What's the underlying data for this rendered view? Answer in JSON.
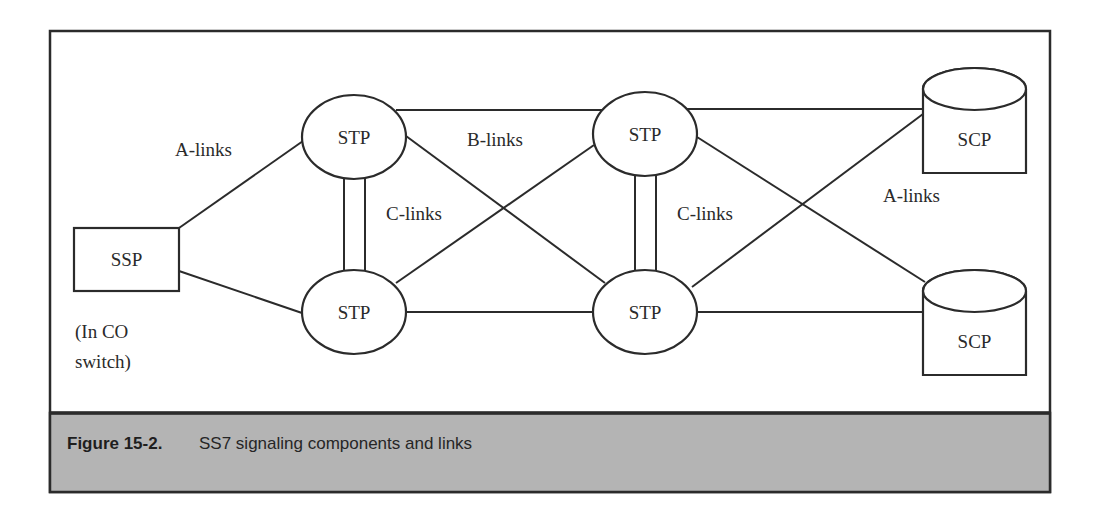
{
  "figure": {
    "number_label": "Figure 15-2.",
    "caption": "SS7 signaling components and links",
    "caption_bar_color": "#b4b4b4",
    "frame_color": "#2b2b2b"
  },
  "nodes": {
    "ssp": {
      "label": "SSP",
      "type": "rectangle"
    },
    "ssp_note": {
      "line1": "(In CO",
      "line2": "switch)"
    },
    "stp_top_left": {
      "label": "STP",
      "type": "ellipse"
    },
    "stp_bottom_left": {
      "label": "STP",
      "type": "ellipse"
    },
    "stp_top_right": {
      "label": "STP",
      "type": "ellipse"
    },
    "stp_bottom_right": {
      "label": "STP",
      "type": "ellipse"
    },
    "scp_top": {
      "label": "SCP",
      "type": "cylinder"
    },
    "scp_bottom": {
      "label": "SCP",
      "type": "cylinder"
    }
  },
  "edge_labels": {
    "a_links_left": "A-links",
    "b_links": "B-links",
    "c_links_left": "C-links",
    "c_links_right": "C-links",
    "a_links_right": "A-links"
  },
  "edges": [
    {
      "from": "SSP",
      "to": "STP (top-left)",
      "type": "A-link"
    },
    {
      "from": "SSP",
      "to": "STP (bottom-left)",
      "type": "A-link"
    },
    {
      "from": "STP (top-left)",
      "to": "STP (bottom-left)",
      "type": "C-link"
    },
    {
      "from": "STP (top-right)",
      "to": "STP (bottom-right)",
      "type": "C-link"
    },
    {
      "from": "STP (top-left)",
      "to": "STP (top-right)",
      "type": "B-link"
    },
    {
      "from": "STP (bottom-left)",
      "to": "STP (bottom-right)",
      "type": "B-link"
    },
    {
      "from": "STP (top-left)",
      "to": "STP (bottom-right)",
      "type": "B-link"
    },
    {
      "from": "STP (bottom-left)",
      "to": "STP (top-right)",
      "type": "B-link"
    },
    {
      "from": "STP (top-right)",
      "to": "SCP (top)",
      "type": "A-link"
    },
    {
      "from": "STP (top-right)",
      "to": "SCP (bottom)",
      "type": "A-link"
    },
    {
      "from": "STP (bottom-right)",
      "to": "SCP (top)",
      "type": "A-link"
    },
    {
      "from": "STP (bottom-right)",
      "to": "SCP (bottom)",
      "type": "A-link"
    }
  ]
}
